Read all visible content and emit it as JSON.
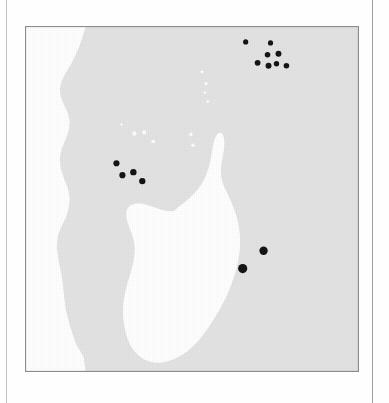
{
  "figure": {
    "type": "distribution-map",
    "region": "Western Indian Ocean",
    "title": "",
    "caption": "",
    "frame": {
      "x": 25,
      "y": 26,
      "width": 334,
      "height": 346
    }
  },
  "colors": {
    "land_fill": "#e3e3e3",
    "ocean_fill": "#ffffff",
    "island_white": "#fdfdfd",
    "locality_dot": "#141414",
    "frame_border": "#8c8c8c",
    "page_rule": "#b9b9b9",
    "page_background": "#fefefe"
  },
  "legend": {
    "visible": false,
    "entries": []
  },
  "axes": {
    "visible": false,
    "ticks": [],
    "graticule": false
  },
  "landmasses": [
    {
      "name": "african-mainland",
      "fill": "land_fill"
    },
    {
      "name": "madagascar",
      "fill": "ocean_fill"
    }
  ],
  "chart_data": {
    "type": "scatter",
    "title": "",
    "xlabel": "",
    "ylabel": "",
    "xlim": [
      0,
      334
    ],
    "ylim": [
      0,
      346
    ],
    "grid": false,
    "legend_position": "none",
    "series": [
      {
        "name": "locality-records",
        "marker": "filled-circle",
        "color": "#141414",
        "points": [
          {
            "label": "seychelles-1",
            "x": 221,
            "y": 15,
            "r": 2.6
          },
          {
            "label": "seychelles-2",
            "x": 246,
            "y": 16,
            "r": 2.6
          },
          {
            "label": "seychelles-3",
            "x": 243,
            "y": 28,
            "r": 2.8
          },
          {
            "label": "seychelles-4",
            "x": 254,
            "y": 27,
            "r": 3.0
          },
          {
            "label": "seychelles-5",
            "x": 233,
            "y": 36,
            "r": 2.9
          },
          {
            "label": "seychelles-6",
            "x": 244,
            "y": 39,
            "r": 3.0
          },
          {
            "label": "seychelles-7",
            "x": 252,
            "y": 37,
            "r": 2.7
          },
          {
            "label": "seychelles-8",
            "x": 262,
            "y": 39,
            "r": 2.8
          },
          {
            "label": "aldabra-comoros-1",
            "x": 91,
            "y": 137,
            "r": 3.1
          },
          {
            "label": "aldabra-comoros-2",
            "x": 97,
            "y": 149,
            "r": 3.1
          },
          {
            "label": "aldabra-comoros-3",
            "x": 108,
            "y": 146,
            "r": 3.2
          },
          {
            "label": "aldabra-comoros-4",
            "x": 117,
            "y": 155,
            "r": 3.2
          },
          {
            "label": "reunion",
            "x": 218,
            "y": 243,
            "r": 4.6
          },
          {
            "label": "mauritius",
            "x": 239,
            "y": 225,
            "r": 4.2
          }
        ]
      },
      {
        "name": "small-islands",
        "marker": "white-speck",
        "color": "#fdfdfd",
        "points": [
          {
            "label": "island-speck-1",
            "x": 177,
            "y": 45,
            "r": 1.6
          },
          {
            "label": "island-speck-2",
            "x": 181,
            "y": 57,
            "r": 1.6
          },
          {
            "label": "island-speck-3",
            "x": 180,
            "y": 66,
            "r": 1.5
          },
          {
            "label": "island-speck-4",
            "x": 183,
            "y": 75,
            "r": 1.4
          },
          {
            "label": "comoros-1",
            "x": 109,
            "y": 107,
            "r": 2.2
          },
          {
            "label": "comoros-2",
            "x": 119,
            "y": 106,
            "r": 2.1
          },
          {
            "label": "comoros-3",
            "x": 128,
            "y": 115,
            "r": 1.9
          },
          {
            "label": "island-speck-5",
            "x": 166,
            "y": 108,
            "r": 1.8
          },
          {
            "label": "island-speck-6",
            "x": 168,
            "y": 119,
            "r": 1.8
          },
          {
            "label": "island-speck-7",
            "x": 96,
            "y": 98,
            "r": 1.2
          },
          {
            "label": "island-speck-8",
            "x": 36,
            "y": 48,
            "r": 1.4
          },
          {
            "label": "island-speck-9",
            "x": 33,
            "y": 57,
            "r": 1.3
          }
        ]
      }
    ]
  }
}
